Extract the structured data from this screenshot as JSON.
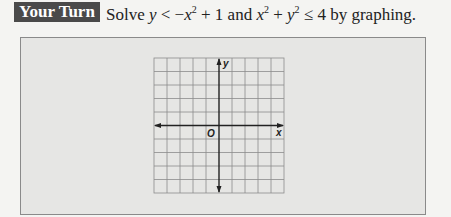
{
  "header": {
    "badge_label": "Your Turn",
    "prompt": {
      "lead": "Solve ",
      "ineq1_var": "y",
      "ineq1_op": " < −",
      "ineq1_x": "x",
      "ineq1_exp": "2",
      "ineq1_tail": " + 1 and ",
      "ineq2_x": "x",
      "ineq2_exp": "2",
      "ineq2_plus": " + ",
      "ineq2_y": "y",
      "ineq2_yexp": "2",
      "ineq2_tail": " ≤ 4 by graphing."
    }
  },
  "graph": {
    "grid_columns": 10,
    "grid_rows": 10,
    "x_label": "x",
    "y_label": "y",
    "origin_label": "O",
    "grid_color": "#8c8c8c",
    "axis_color": "#222222"
  }
}
